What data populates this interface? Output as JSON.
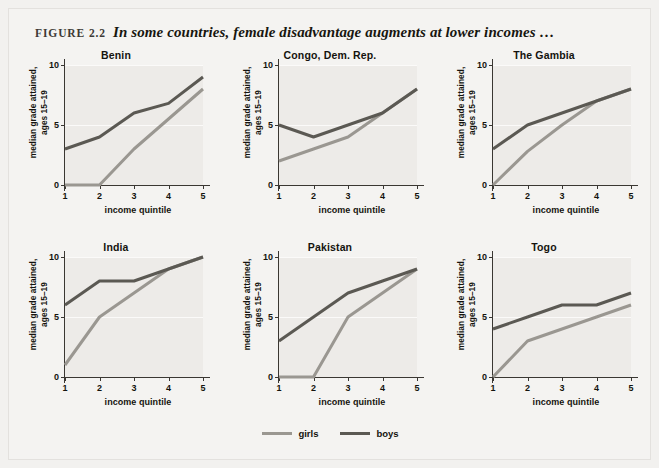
{
  "figure": {
    "label": "FIGURE 2.2",
    "caption": "In some countries, female disadvantage augments at lower incomes …"
  },
  "axes": {
    "ylabel_line1": "median grade attained,",
    "ylabel_line2": "ages 15–19",
    "xlabel": "income quintile",
    "yticks": [
      "0",
      "5",
      "10"
    ],
    "xticks": [
      "1",
      "2",
      "3",
      "4",
      "5"
    ]
  },
  "legend": {
    "position": "bottom-center",
    "items": [
      {
        "label": "girls",
        "color": "#9a9791"
      },
      {
        "label": "boys",
        "color": "#5b5953"
      }
    ]
  },
  "colors": {
    "girls": "#9a9791",
    "boys": "#5b5953",
    "plot_background": "#edebe8",
    "figure_background": "#f4f3f1",
    "page_background": "#f2f1ef",
    "axis": "#3a3732",
    "text": "#14130e"
  },
  "chart_data": {
    "type": "line",
    "title": "In some countries, female disadvantage augments at lower incomes …",
    "xlabel": "income quintile",
    "ylabel": "median grade attained, ages 15–19",
    "x": [
      1,
      2,
      3,
      4,
      5
    ],
    "xlim": [
      1,
      5
    ],
    "ylim": [
      0,
      10
    ],
    "yticks": [
      0,
      5,
      10
    ],
    "grid": "horizontal-white-at-5-and-10",
    "legend": [
      "girls",
      "boys"
    ],
    "panels": [
      {
        "title": "Benin",
        "series": [
          {
            "name": "girls",
            "values": [
              0,
              0,
              3,
              5.5,
              8
            ]
          },
          {
            "name": "boys",
            "values": [
              3,
              4,
              6,
              6.8,
              9
            ]
          }
        ]
      },
      {
        "title": "Congo, Dem. Rep.",
        "series": [
          {
            "name": "girls",
            "values": [
              2,
              3,
              4,
              6,
              8
            ]
          },
          {
            "name": "boys",
            "values": [
              5,
              4,
              5,
              6,
              8
            ]
          }
        ]
      },
      {
        "title": "The Gambia",
        "series": [
          {
            "name": "girls",
            "values": [
              0,
              2.8,
              5,
              7,
              8
            ]
          },
          {
            "name": "boys",
            "values": [
              3,
              5,
              6,
              7,
              8
            ]
          }
        ]
      },
      {
        "title": "India",
        "series": [
          {
            "name": "girls",
            "values": [
              1,
              5,
              7,
              9,
              10
            ]
          },
          {
            "name": "boys",
            "values": [
              6,
              8,
              8,
              9,
              10
            ]
          }
        ]
      },
      {
        "title": "Pakistan",
        "series": [
          {
            "name": "girls",
            "values": [
              0,
              0,
              5,
              7,
              9
            ]
          },
          {
            "name": "boys",
            "values": [
              3,
              5,
              7,
              8,
              9
            ]
          }
        ]
      },
      {
        "title": "Togo",
        "series": [
          {
            "name": "girls",
            "values": [
              0,
              3,
              4,
              5,
              6
            ]
          },
          {
            "name": "boys",
            "values": [
              4,
              5,
              6,
              6,
              7
            ]
          }
        ]
      }
    ]
  }
}
